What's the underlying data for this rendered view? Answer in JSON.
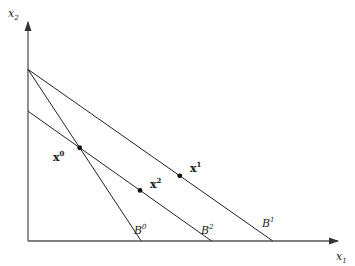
{
  "diagram": {
    "axes": {
      "x_label": "x",
      "x_label_sub": "1",
      "y_label": "x",
      "y_label_sub": "2"
    },
    "budget_lines": [
      {
        "id": "B0",
        "label": "B",
        "sup": "0",
        "y_intercept": 0.78,
        "x_intercept": 0.37
      },
      {
        "id": "B2",
        "label": "B",
        "sup": "2",
        "y_intercept": 0.59,
        "x_intercept": 0.6
      },
      {
        "id": "B1",
        "label": "B",
        "sup": "1",
        "y_intercept": 0.78,
        "x_intercept": 0.8
      }
    ],
    "points": [
      {
        "id": "x0",
        "label": "x",
        "sup": "0",
        "on": [
          "B0",
          "B2"
        ]
      },
      {
        "id": "x2",
        "label": "x",
        "sup": "2",
        "on": [
          "B2"
        ]
      },
      {
        "id": "x1",
        "label": "x",
        "sup": "1",
        "on": [
          "B1"
        ]
      }
    ],
    "colors": {
      "line": "#222222",
      "axis": "#555555",
      "point": "#111111"
    }
  }
}
